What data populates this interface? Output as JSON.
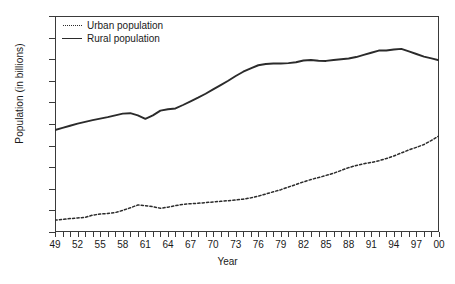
{
  "chart_data": {
    "type": "line",
    "title": "",
    "xlabel": "Year",
    "ylabel": "Population (in billions)",
    "ylim": [
      0,
      1
    ],
    "ytick_labels": [
      "1",
      "0.9",
      "0.8",
      "0.7",
      "0.6",
      "0.5",
      "0.4",
      "0.3",
      "0.2",
      "0.1",
      "0"
    ],
    "ytick_values": [
      1,
      0.9,
      0.8,
      0.7,
      0.6,
      0.5,
      0.4,
      0.3,
      0.2,
      0.1,
      0
    ],
    "grid": false,
    "legend_position": "top-left",
    "x": [
      1949,
      1950,
      1951,
      1952,
      1953,
      1954,
      1955,
      1956,
      1957,
      1958,
      1959,
      1960,
      1961,
      1962,
      1963,
      1964,
      1965,
      1966,
      1967,
      1968,
      1969,
      1970,
      1971,
      1972,
      1973,
      1974,
      1975,
      1976,
      1977,
      1978,
      1979,
      1980,
      1981,
      1982,
      1983,
      1984,
      1985,
      1986,
      1987,
      1988,
      1989,
      1990,
      1991,
      1992,
      1993,
      1994,
      1995,
      1996,
      1997,
      1998,
      1999,
      2000
    ],
    "xtick_labels": [
      "49",
      "52",
      "55",
      "58",
      "61",
      "64",
      "67",
      "70",
      "73",
      "76",
      "79",
      "82",
      "85",
      "88",
      "91",
      "94",
      "97",
      "00"
    ],
    "xtick_label_values": [
      1949,
      1952,
      1955,
      1958,
      1961,
      1964,
      1967,
      1970,
      1973,
      1976,
      1979,
      1982,
      1985,
      1988,
      1991,
      1994,
      1997,
      2000
    ],
    "xtick_every": 1,
    "xtick_label_every": 3,
    "series": [
      {
        "name": "Urban population",
        "style": "dotted",
        "color": "#2b2b2b",
        "values": [
          0.055,
          0.058,
          0.062,
          0.065,
          0.068,
          0.078,
          0.083,
          0.086,
          0.09,
          0.1,
          0.112,
          0.125,
          0.122,
          0.117,
          0.11,
          0.115,
          0.122,
          0.128,
          0.131,
          0.133,
          0.136,
          0.139,
          0.142,
          0.145,
          0.148,
          0.152,
          0.158,
          0.166,
          0.176,
          0.186,
          0.196,
          0.208,
          0.22,
          0.232,
          0.243,
          0.252,
          0.262,
          0.272,
          0.285,
          0.298,
          0.308,
          0.316,
          0.322,
          0.33,
          0.34,
          0.352,
          0.366,
          0.38,
          0.392,
          0.405,
          0.424,
          0.445
        ]
      },
      {
        "name": "Rural population",
        "style": "solid",
        "color": "#2b2b2b",
        "values": [
          0.472,
          0.482,
          0.492,
          0.502,
          0.51,
          0.518,
          0.525,
          0.532,
          0.54,
          0.548,
          0.55,
          0.54,
          0.524,
          0.54,
          0.562,
          0.568,
          0.572,
          0.588,
          0.605,
          0.622,
          0.64,
          0.66,
          0.68,
          0.7,
          0.722,
          0.742,
          0.758,
          0.772,
          0.778,
          0.78,
          0.78,
          0.782,
          0.786,
          0.794,
          0.796,
          0.793,
          0.792,
          0.796,
          0.8,
          0.803,
          0.81,
          0.82,
          0.83,
          0.84,
          0.84,
          0.845,
          0.848,
          0.836,
          0.824,
          0.812,
          0.804,
          0.795
        ]
      }
    ]
  },
  "caption": {
    "text": ""
  }
}
